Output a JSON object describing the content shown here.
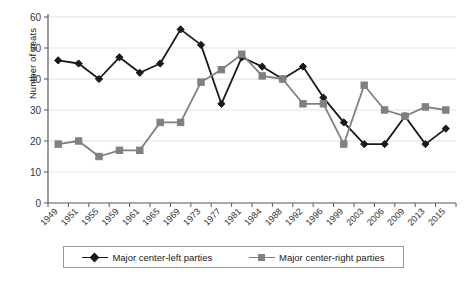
{
  "chart_data": {
    "type": "line",
    "title": "",
    "xlabel": "",
    "ylabel": "Number of seats",
    "ylim": [
      0,
      60
    ],
    "ytick_step": 10,
    "yticks": [
      0,
      10,
      20,
      30,
      40,
      50,
      60
    ],
    "grid": "horizontal",
    "legend_position": "bottom",
    "categories": [
      "1949",
      "1951",
      "1955",
      "1959",
      "1961",
      "1965",
      "1969",
      "1973",
      "1977",
      "1981",
      "1984",
      "1988",
      "1992",
      "1996",
      "1999",
      "2003",
      "2006",
      "2009",
      "2013",
      "2015"
    ],
    "series": [
      {
        "name": "Major center-left parties",
        "color": "#1a1a1a",
        "marker": "diamond",
        "values": [
          46,
          45,
          40,
          47,
          42,
          45,
          56,
          51,
          32,
          47,
          44,
          40,
          44,
          34,
          26,
          19,
          19,
          28,
          19,
          24
        ]
      },
      {
        "name": "Major center-right parties",
        "color": "#808080",
        "marker": "square",
        "values": [
          19,
          20,
          15,
          17,
          17,
          26,
          26,
          39,
          43,
          48,
          41,
          40,
          32,
          32,
          19,
          38,
          30,
          28,
          31,
          30
        ]
      }
    ]
  },
  "axis": {
    "y_title": "Number of seats"
  },
  "legend": {
    "items": [
      {
        "label": "Major center-left parties"
      },
      {
        "label": "Major center-right parties"
      }
    ]
  },
  "colors": {
    "series_left": "#1a1a1a",
    "series_right": "#808080",
    "grid": "#e2e2e2",
    "axis": "#595959",
    "background": "#ffffff"
  }
}
